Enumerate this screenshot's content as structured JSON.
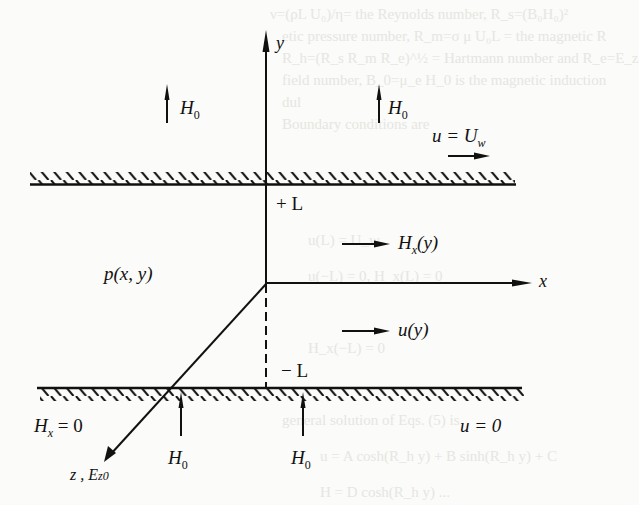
{
  "diagram": {
    "type": "Hartmann flow between parallel plates (MHD channel flow schematic)",
    "background_bleed_text": [
      "ν=(ρL U₀)/η= the Reynolds number, R_s=(B₀H₀)²",
      "etic pressure number, R_m=σ μ U₀L = the magnetic R",
      "R_h=(R_s R_m R_e)^½ = Hartmann number and R_e=E_z",
      "field number, B_0=μ_e H_0 is the magnetic induction",
      "dul",
      "Boundary conditions are",
      "u(L) = U_w",
      "u(−L) = 0,  H_x(L) = 0",
      "H_x(−L) = 0",
      "general solution of Eqs. (5) is",
      "u = A cosh(R_h y) + B sinh(R_h y) + C",
      "H = D cosh(R_h y) ..."
    ],
    "axes": {
      "y_label": "y",
      "x_label": "x",
      "z_label": "z , E",
      "z_label_sub": "z0"
    },
    "upper_wall": {
      "position_label": "+ L",
      "velocity_label": "u = U",
      "velocity_sub": "w"
    },
    "lower_wall": {
      "position_label": "− L",
      "field_bc_label": "H",
      "field_bc_sub": "x",
      "field_bc_value": " = 0",
      "velocity_label": "u = 0"
    },
    "field_arrows": [
      {
        "label": "H",
        "sub": "0",
        "location": "above upper wall, left"
      },
      {
        "label": "H",
        "sub": "0",
        "location": "above upper wall, right"
      },
      {
        "label": "H",
        "sub": "0",
        "location": "below lower wall, left"
      },
      {
        "label": "H",
        "sub": "0",
        "location": "below lower wall, right"
      }
    ],
    "flow_labels": {
      "induced_field": "H",
      "induced_field_sub": "x",
      "induced_field_arg": "(y)",
      "velocity": "u(y)",
      "pressure": "p(x, y)"
    }
  }
}
